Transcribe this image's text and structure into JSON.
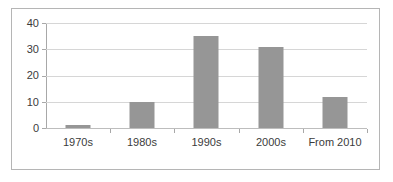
{
  "chart_data": {
    "type": "bar",
    "title": "",
    "subtitle": "",
    "xlabel": "",
    "ylabel": "",
    "categories": [
      "1970s",
      "1980s",
      "1990s",
      "2000s",
      "From 2010"
    ],
    "values": [
      1,
      10,
      35,
      31,
      12
    ],
    "ylim": [
      0,
      40
    ],
    "yticks": [
      0,
      10,
      20,
      30,
      40
    ],
    "ytick_labels": [
      "0",
      "10",
      "20",
      "30",
      "40"
    ],
    "grid": true,
    "legend": false,
    "legend_position": "none",
    "series": [
      {
        "name": "",
        "values": [
          1,
          10,
          35,
          31,
          12
        ]
      }
    ]
  },
  "colors": {
    "bar": "#969696",
    "gridline": "#d6d6d6",
    "axis": "#a8a8a8",
    "frame": "#b5b5b5",
    "text": "#3b3b3b",
    "background": "#ffffff"
  }
}
